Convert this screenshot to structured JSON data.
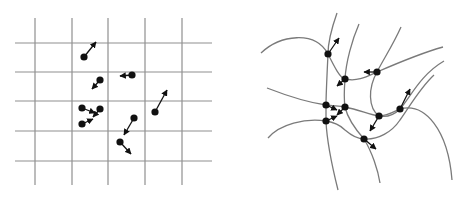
{
  "colors": {
    "grid": "#8f8f8f",
    "curve": "#7a7a7a",
    "dot": "#111111",
    "arrow": "#111111"
  },
  "left_panel": {
    "type": "regular-grid",
    "vertical_lines_x": [
      35,
      72,
      108,
      145,
      182
    ],
    "horizontal_lines_y": [
      43,
      72,
      101,
      131,
      161
    ],
    "x_span": [
      15,
      212
    ],
    "y_span": [
      18,
      185
    ],
    "particles": [
      {
        "x": 84,
        "y": 57,
        "ax": 96,
        "ay": 42
      },
      {
        "x": 100,
        "y": 80,
        "ax": 92,
        "ay": 89
      },
      {
        "x": 132,
        "y": 75,
        "ax": 120,
        "ay": 76
      },
      {
        "x": 82,
        "y": 108,
        "ax": 95,
        "ay": 113
      },
      {
        "x": 100,
        "y": 109,
        "ax": 93,
        "ay": 117
      },
      {
        "x": 82,
        "y": 124,
        "ax": 93,
        "ay": 119
      },
      {
        "x": 134,
        "y": 118,
        "ax": 124,
        "ay": 135
      },
      {
        "x": 155,
        "y": 112,
        "ax": 167,
        "ay": 90
      },
      {
        "x": 120,
        "y": 142,
        "ax": 131,
        "ay": 154
      }
    ]
  },
  "right_panel": {
    "type": "deformed-mesh",
    "curves": [
      "M261,53 C280,35 315,30 328,54 C335,68 340,78 345,79 C358,82 368,76 377,72 C400,62 425,52 443,47",
      "M337,13 C331,30 328,45 328,54 C327,75 326,95 326,105 C326,112 326,117 326,121 C327,145 333,170 338,190",
      "M359,24 C352,40 346,62 345,79 C344,92 344,100 345,107 C348,120 356,130 364,139 C372,152 378,170 380,183",
      "M401,27 C393,45 383,60 377,72 C368,88 368,108 379,116 C390,118 396,113 400,109 C410,98 420,75 444,61",
      "M267,88 C285,95 305,102 326,105 C333,106 339,106 345,107 C360,110 370,115 379,116 C388,116 395,111 400,109 C425,102 448,130 452,180",
      "M268,138 C280,124 305,118 326,121 C333,122 339,124 345,130 C352,136 358,139 364,139 C378,140 392,132 400,120 C410,106 420,88 434,75"
    ],
    "particles": [
      {
        "x": 328,
        "y": 54,
        "ax": 339,
        "ay": 38
      },
      {
        "x": 345,
        "y": 79,
        "ax": 337,
        "ay": 86
      },
      {
        "x": 377,
        "y": 72,
        "ax": 364,
        "ay": 72
      },
      {
        "x": 326,
        "y": 105,
        "ax": 337,
        "ay": 110
      },
      {
        "x": 345,
        "y": 107,
        "ax": 337,
        "ay": 115
      },
      {
        "x": 326,
        "y": 121,
        "ax": 337,
        "ay": 116
      },
      {
        "x": 379,
        "y": 116,
        "ax": 370,
        "ay": 131
      },
      {
        "x": 400,
        "y": 109,
        "ax": 410,
        "ay": 89
      },
      {
        "x": 364,
        "y": 139,
        "ax": 376,
        "ay": 149
      }
    ]
  }
}
